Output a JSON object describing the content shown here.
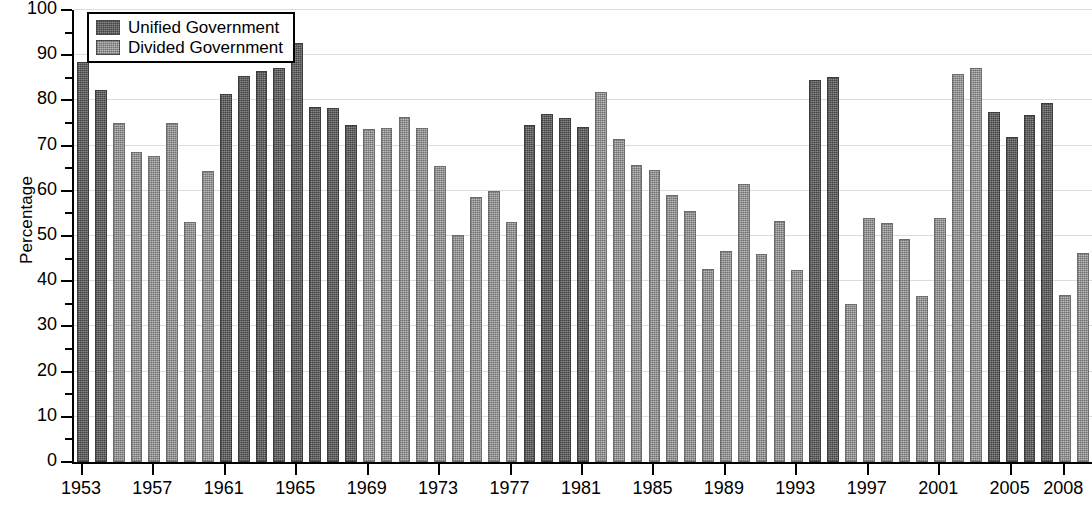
{
  "chart_data": {
    "type": "bar",
    "title": "",
    "xlabel": "",
    "ylabel": "Percentage",
    "ylim": [
      0,
      100
    ],
    "ytick_step": 10,
    "yticks": [
      0,
      10,
      20,
      30,
      40,
      50,
      60,
      70,
      80,
      90,
      100
    ],
    "xticks": [
      "1953",
      "1957",
      "1961",
      "1965",
      "1969",
      "1973",
      "1977",
      "1981",
      "1985",
      "1989",
      "1993",
      "1997",
      "2001",
      "2005",
      "2008"
    ],
    "grid": true,
    "legend_position": "top-left",
    "legend": [
      {
        "name": "Unified Government",
        "color": "#6e6e6e"
      },
      {
        "name": "Divided Government",
        "color": "#9d9d9d"
      }
    ],
    "categories": [
      "1953",
      "1954",
      "1955",
      "1956",
      "1957",
      "1958",
      "1959",
      "1960",
      "1961",
      "1962",
      "1963",
      "1964",
      "1965",
      "1966",
      "1967",
      "1968",
      "1969",
      "1970",
      "1971",
      "1972",
      "1973",
      "1974",
      "1975",
      "1976",
      "1977",
      "1978",
      "1979",
      "1980",
      "1981",
      "1982",
      "1983",
      "1984",
      "1985",
      "1986",
      "1987",
      "1988",
      "1989",
      "1990",
      "1991",
      "1992",
      "1993",
      "1994",
      "1995",
      "1996",
      "1997",
      "1998",
      "1999",
      "2000",
      "2001",
      "2002",
      "2003",
      "2004",
      "2005",
      "2006",
      "2007",
      "2008"
    ],
    "points": [
      {
        "year": "1953",
        "value": 88.5,
        "series": "Unified Government"
      },
      {
        "year": "1954",
        "value": 82.3,
        "series": "Unified Government"
      },
      {
        "year": "1955",
        "value": 75.0,
        "series": "Divided Government"
      },
      {
        "year": "1956",
        "value": 68.6,
        "series": "Divided Government"
      },
      {
        "year": "1957",
        "value": 67.8,
        "series": "Divided Government"
      },
      {
        "year": "1958",
        "value": 75.1,
        "series": "Divided Government"
      },
      {
        "year": "1959",
        "value": 53.1,
        "series": "Divided Government"
      },
      {
        "year": "1960",
        "value": 64.4,
        "series": "Divided Government"
      },
      {
        "year": "1961",
        "value": 81.4,
        "series": "Unified Government"
      },
      {
        "year": "1962",
        "value": 85.4,
        "series": "Unified Government"
      },
      {
        "year": "1963",
        "value": 86.4,
        "series": "Unified Government"
      },
      {
        "year": "1964",
        "value": 87.1,
        "series": "Unified Government"
      },
      {
        "year": "1965",
        "value": 92.6,
        "series": "Unified Government"
      },
      {
        "year": "1966",
        "value": 78.6,
        "series": "Unified Government"
      },
      {
        "year": "1967",
        "value": 78.4,
        "series": "Unified Government"
      },
      {
        "year": "1968",
        "value": 74.5,
        "series": "Unified Government"
      },
      {
        "year": "1969",
        "value": 73.7,
        "series": "Divided Government"
      },
      {
        "year": "1970",
        "value": 74.0,
        "series": "Divided Government"
      },
      {
        "year": "1971",
        "value": 76.3,
        "series": "Divided Government"
      },
      {
        "year": "1972",
        "value": 74.0,
        "series": "Divided Government"
      },
      {
        "year": "1973",
        "value": 65.6,
        "series": "Divided Government"
      },
      {
        "year": "1974",
        "value": 50.3,
        "series": "Divided Government"
      },
      {
        "year": "1975",
        "value": 58.6,
        "series": "Divided Government"
      },
      {
        "year": "1976",
        "value": 60.0,
        "series": "Divided Government"
      },
      {
        "year": "1977",
        "value": 53.1,
        "series": "Divided Government"
      },
      {
        "year": "1978",
        "value": 74.5,
        "series": "Unified Government"
      },
      {
        "year": "1979",
        "value": 77.0,
        "series": "Unified Government"
      },
      {
        "year": "1980",
        "value": 76.1,
        "series": "Unified Government"
      },
      {
        "year": "1981",
        "value": 74.1,
        "series": "Unified Government"
      },
      {
        "year": "1982",
        "value": 81.8,
        "series": "Divided Government"
      },
      {
        "year": "1983",
        "value": 71.4,
        "series": "Divided Government"
      },
      {
        "year": "1984",
        "value": 65.8,
        "series": "Divided Government"
      },
      {
        "year": "1985",
        "value": 64.7,
        "series": "Divided Government"
      },
      {
        "year": "1986",
        "value": 59.0,
        "series": "Divided Government"
      },
      {
        "year": "1987",
        "value": 55.5,
        "series": "Divided Government"
      },
      {
        "year": "1988",
        "value": 42.6,
        "series": "Divided Government"
      },
      {
        "year": "1989",
        "value": 46.6,
        "series": "Divided Government"
      },
      {
        "year": "1990",
        "value": 61.5,
        "series": "Divided Government"
      },
      {
        "year": "1991",
        "value": 46.1,
        "series": "Divided Government"
      },
      {
        "year": "1992",
        "value": 53.3,
        "series": "Divided Government"
      },
      {
        "year": "1993",
        "value": 42.4,
        "series": "Divided Government"
      },
      {
        "year": "1994",
        "value": 84.6,
        "series": "Unified Government"
      },
      {
        "year": "1995",
        "value": 85.2,
        "series": "Unified Government"
      },
      {
        "year": "1996",
        "value": 35.0,
        "series": "Divided Government"
      },
      {
        "year": "1997",
        "value": 54.0,
        "series": "Divided Government"
      },
      {
        "year": "1998",
        "value": 52.8,
        "series": "Divided Government"
      },
      {
        "year": "1999",
        "value": 49.4,
        "series": "Divided Government"
      },
      {
        "year": "2000",
        "value": 36.7,
        "series": "Divided Government"
      },
      {
        "year": "2001",
        "value": 54.0,
        "series": "Divided Government"
      },
      {
        "year": "2002",
        "value": 85.8,
        "series": "Divided Government"
      },
      {
        "year": "2003",
        "value": 87.2,
        "series": "Divided Government"
      },
      {
        "year": "2004",
        "value": 77.4,
        "series": "Unified Government"
      },
      {
        "year": "2005",
        "value": 71.8,
        "series": "Unified Government"
      },
      {
        "year": "2006",
        "value": 76.8,
        "series": "Unified Government"
      },
      {
        "year": "2007",
        "value": 79.4,
        "series": "Unified Government"
      },
      {
        "year": "2008",
        "value": 36.9,
        "series": "Divided Government"
      },
      {
        "year": "2008b",
        "value": 46.3,
        "series": "Divided Government"
      }
    ]
  }
}
